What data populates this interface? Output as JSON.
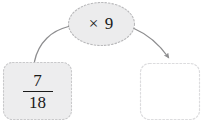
{
  "diagram": {
    "type": "fraction-operation-flow",
    "operator_node": {
      "label": "× 9",
      "shape": "ellipse",
      "fill": "#ececed",
      "border_color": "#b9b9bb",
      "border_style": "dashed"
    },
    "input_node": {
      "numerator": "7",
      "denominator": "18",
      "shape": "rounded-rect",
      "fill": "#ededee",
      "border_color": "#c9c9cb",
      "border_style": "dashed"
    },
    "output_node": {
      "label": "",
      "shape": "rounded-rect",
      "fill": "#ffffff",
      "border_color": "#dcdcde",
      "border_style": "dashed"
    },
    "connectors": {
      "input_to_operator": {
        "name": "left-curve",
        "has_arrowhead": false,
        "color": "#8d8d8f"
      },
      "operator_to_output": {
        "name": "right-arrow",
        "has_arrowhead": true,
        "color": "#8d8d8f"
      }
    }
  }
}
